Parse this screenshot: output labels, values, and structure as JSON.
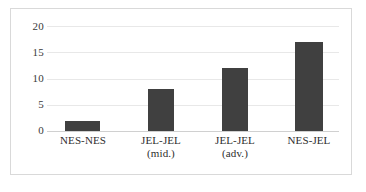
{
  "chart_data": {
    "type": "bar",
    "title": "",
    "subtitle": "",
    "xlabel": "",
    "ylabel": "",
    "categories": [
      "NES-NES",
      "JEL-JEL (mid.)",
      "JEL-JEL (adv.)",
      "NES-JEL"
    ],
    "category_lines": [
      [
        "NES-NES",
        ""
      ],
      [
        "JEL-JEL",
        "(mid.)"
      ],
      [
        "JEL-JEL",
        "(adv.)"
      ],
      [
        "NES-JEL",
        ""
      ]
    ],
    "values": [
      2,
      8,
      12,
      17
    ],
    "ylim": [
      0,
      20
    ],
    "yticks": [
      0,
      5,
      10,
      15,
      20
    ],
    "ytick_labels": [
      "0",
      "5",
      "10",
      "15",
      "20"
    ],
    "grid": true,
    "grid_axis": "y",
    "legend": false,
    "legend_position": "none",
    "bar_color": "#404040",
    "grid_color": "#e8e8e8",
    "frame_color": "#d9d9d9",
    "background_color": "#ffffff",
    "text_color": "#2e2e2e"
  }
}
